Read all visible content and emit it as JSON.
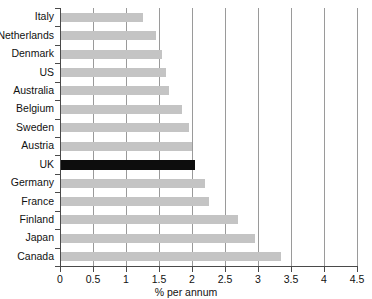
{
  "chart_data": {
    "type": "bar",
    "orientation": "horizontal",
    "title": "",
    "xlabel": "% per annum",
    "ylabel": "",
    "xlim": [
      0,
      4.5
    ],
    "xticks": [
      "0",
      "0.5",
      "1",
      "1.5",
      "2",
      "2.5",
      "3",
      "3.5",
      "4",
      "4.5"
    ],
    "xtick_values": [
      0,
      0.5,
      1,
      1.5,
      2,
      2.5,
      3,
      3.5,
      4,
      4.5
    ],
    "grid": "vertical",
    "legend": "none",
    "categories": [
      "Italy",
      "Netherlands",
      "Denmark",
      "US",
      "Australia",
      "Belgium",
      "Sweden",
      "Austria",
      "UK",
      "Germany",
      "France",
      "Finland",
      "Japan",
      "Canada"
    ],
    "values": [
      1.25,
      1.45,
      1.55,
      1.6,
      1.65,
      1.85,
      1.95,
      2.0,
      2.05,
      2.2,
      2.25,
      2.7,
      2.95,
      3.35
    ],
    "highlight_category": "UK",
    "colors": {
      "bar": "#c4c4c4",
      "highlight_bar": "#0d0d0d",
      "gridline": "#9a9a9a",
      "axis": "#4a4a4a",
      "text": "#111111",
      "background": "#ffffff"
    }
  }
}
